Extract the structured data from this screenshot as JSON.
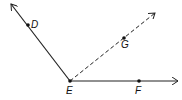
{
  "diagram": {
    "type": "geometry-angles",
    "vertex": {
      "label": "E",
      "x": 70,
      "y": 81
    },
    "rays": [
      {
        "name": "ray-ED",
        "from": "E",
        "through": "D",
        "style": "solid",
        "tip": {
          "x": 11,
          "y": 4
        }
      },
      {
        "name": "ray-EG",
        "from": "E",
        "through": "G",
        "style": "dashed",
        "tip": {
          "x": 155,
          "y": 13
        }
      },
      {
        "name": "ray-EF",
        "from": "E",
        "through": "F",
        "style": "solid",
        "tip": {
          "x": 178,
          "y": 81
        }
      }
    ],
    "points": [
      {
        "label": "D",
        "x": 28,
        "y": 25,
        "label_x": 31,
        "label_y": 27
      },
      {
        "label": "E",
        "x": 70,
        "y": 81,
        "label_x": 66,
        "label_y": 93
      },
      {
        "label": "G",
        "x": 124,
        "y": 38,
        "label_x": 121,
        "label_y": 48
      },
      {
        "label": "F",
        "x": 139,
        "y": 81,
        "label_x": 135,
        "label_y": 93
      }
    ],
    "colors": {
      "line": "#222222",
      "background": "#ffffff"
    }
  }
}
